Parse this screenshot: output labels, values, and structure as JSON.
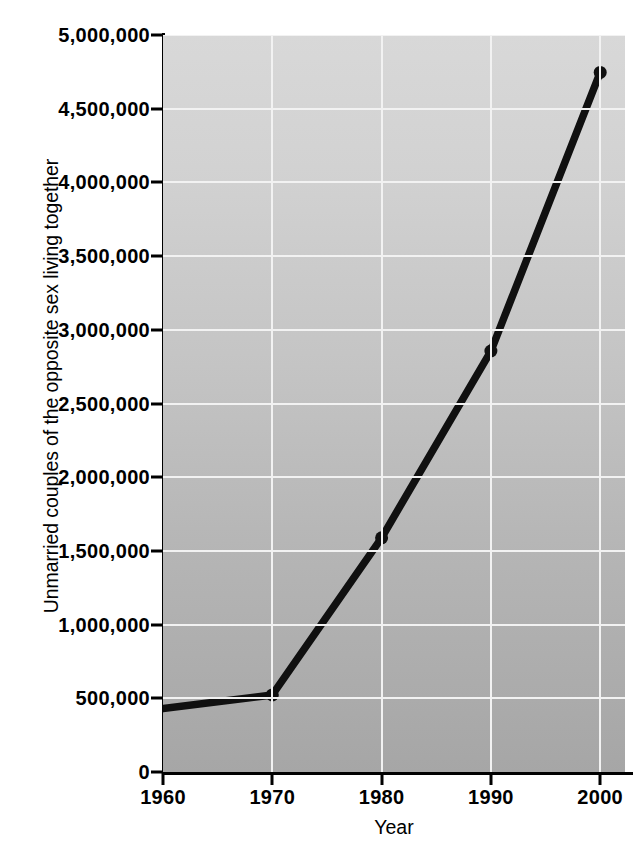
{
  "chart_data": {
    "type": "line",
    "title": "",
    "xlabel": "Year",
    "ylabel": "Unmarried couples of the opposite sex living together",
    "x": [
      1960,
      1970,
      1980,
      1990,
      2000
    ],
    "values": [
      430000,
      523000,
      1589000,
      2856000,
      4746000
    ],
    "series": [
      {
        "name": "Unmarried couples of the opposite sex living together",
        "values": [
          430000,
          523000,
          1589000,
          2856000,
          4746000
        ]
      }
    ],
    "xlim": [
      1960,
      2002
    ],
    "ylim": [
      0,
      5000000
    ],
    "xticks": [
      1960,
      1970,
      1980,
      1990,
      2000
    ],
    "xtick_labels": [
      "1960",
      "1970",
      "1980",
      "1990",
      "2000"
    ],
    "yticks": [
      0,
      500000,
      1000000,
      1500000,
      2000000,
      2500000,
      3000000,
      3500000,
      4000000,
      4500000,
      5000000
    ],
    "ytick_labels": [
      "0",
      "500,000",
      "1,000,000",
      "1,500,000",
      "2,000,000",
      "2,500,000",
      "3,000,000",
      "3,500,000",
      "4,000,000",
      "4,500,000",
      "5,000,000"
    ],
    "grid": true,
    "legend": "none",
    "line_color": "#101010",
    "marker": "circle",
    "plot_background": "#c2c2c2",
    "gridline_color": "#f2f2f2",
    "figure_background": "#ffffff"
  }
}
